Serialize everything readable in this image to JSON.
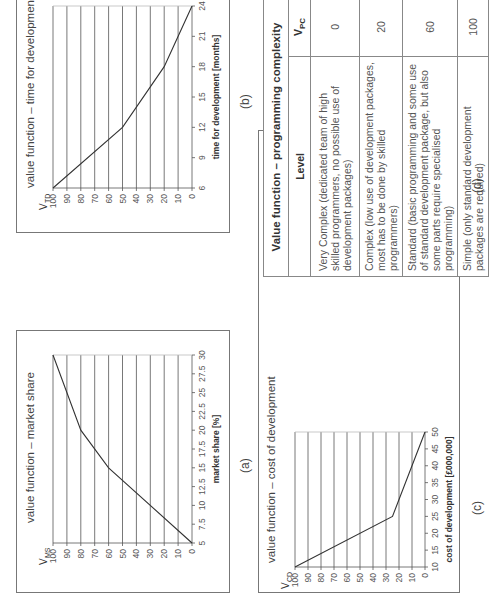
{
  "figure": {
    "panels": [
      {
        "id": "a",
        "label": "(a)",
        "title": "value function – market share",
        "ylabel": "V",
        "ylabel_sub": "MS",
        "xlabel": "market share [%]"
      },
      {
        "id": "b",
        "label": "(b)",
        "title": "value function – time for development",
        "ylabel": "V",
        "ylabel_sub": "TD",
        "xlabel": "time for development [months]"
      },
      {
        "id": "c",
        "label": "(c)",
        "title": "value function – cost of development",
        "ylabel": "V",
        "ylabel_sub": "CD",
        "xlabel": "cost of development [£000,000]"
      },
      {
        "id": "d",
        "label": "(d)",
        "title": "Value function – programming complexity",
        "col_level": "Level",
        "col_value": "V",
        "col_value_sub": "PC",
        "rows": [
          {
            "level": "Very Complex (dedicated team of high skilled programmers, no possible use of development packages)",
            "value": "0"
          },
          {
            "level": "Complex (low use of development packages, most has to be done by skilled programmers)",
            "value": "20"
          },
          {
            "level": "Standard (basic programming and some use of standard development package, but also some parts require specialised programming)",
            "value": "60"
          },
          {
            "level": "Simple (only standard development packages are required)",
            "value": "100"
          }
        ]
      }
    ]
  },
  "chart_data": [
    {
      "type": "line",
      "title": "value function – market share",
      "xlabel": "market share [%]",
      "ylabel": "V_MS",
      "x_ticks": [
        "5",
        "7.5",
        "10",
        "12.5",
        "15",
        "17.5",
        "20",
        "22.5",
        "25",
        "27.5",
        "30"
      ],
      "y_ticks": [
        "0",
        "10",
        "20",
        "30",
        "40",
        "50",
        "60",
        "70",
        "80",
        "90",
        "100"
      ],
      "xlim": [
        5,
        30
      ],
      "ylim": [
        0,
        100
      ],
      "grid": "horizontal",
      "x": [
        5,
        15,
        20,
        30
      ],
      "values": [
        0,
        60,
        80,
        100
      ]
    },
    {
      "type": "line",
      "title": "value function – time for development",
      "xlabel": "time for development [months]",
      "ylabel": "V_TD",
      "x_ticks": [
        "6",
        "9",
        "12",
        "15",
        "18",
        "21",
        "24"
      ],
      "y_ticks": [
        "0",
        "10",
        "20",
        "30",
        "40",
        "50",
        "60",
        "70",
        "80",
        "90",
        "100"
      ],
      "xlim": [
        6,
        24
      ],
      "ylim": [
        0,
        100
      ],
      "grid": "horizontal",
      "x": [
        6,
        12,
        18,
        24
      ],
      "values": [
        100,
        50,
        20,
        0
      ]
    },
    {
      "type": "line",
      "title": "value function – cost of development",
      "xlabel": "cost of development [£000,000]",
      "ylabel": "V_CD",
      "x_ticks": [
        "10",
        "15",
        "20",
        "25",
        "30",
        "35",
        "40",
        "45",
        "50"
      ],
      "y_ticks": [
        "0",
        "10",
        "20",
        "30",
        "40",
        "50",
        "60",
        "70",
        "80",
        "90",
        "100"
      ],
      "xlim": [
        10,
        50
      ],
      "ylim": [
        0,
        100
      ],
      "grid": "horizontal",
      "x": [
        10,
        25,
        50
      ],
      "values": [
        100,
        25,
        0
      ]
    },
    {
      "type": "table",
      "title": "Value function – programming complexity",
      "columns": [
        "Level",
        "V_PC"
      ],
      "rows": [
        [
          "Very Complex (dedicated team of high skilled programmers, no possible use of development packages)",
          0
        ],
        [
          "Complex (low use of development packages, most has to be done by skilled programmers)",
          20
        ],
        [
          "Standard (basic programming and some use of standard development package, but also some parts require specialised programming)",
          60
        ],
        [
          "Simple (only standard development packages are required)",
          100
        ]
      ]
    }
  ]
}
